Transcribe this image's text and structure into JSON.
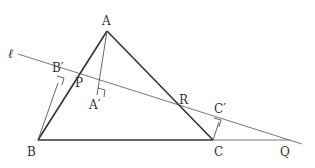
{
  "diagram": {
    "type": "geometry",
    "colors": {
      "triangle": "#333333",
      "line": "#777777",
      "perpendicular": "#555555",
      "label": "#333333"
    },
    "points": {
      "A": {
        "label": "A",
        "x": 107,
        "y": 31
      },
      "B": {
        "label": "B",
        "x": 38,
        "y": 140
      },
      "C": {
        "label": "C",
        "x": 213,
        "y": 140
      },
      "Q": {
        "label": "Q",
        "x": 290,
        "y": 140
      },
      "P": {
        "label": "P",
        "x": 82,
        "y": 91
      },
      "R": {
        "label": "R",
        "x": 181,
        "y": 110
      },
      "A_prime": {
        "label": "A′",
        "x": 97,
        "y": 95
      },
      "B_prime": {
        "label": "B′",
        "x": 58,
        "y": 83
      },
      "C_prime": {
        "label": "C′",
        "x": 219,
        "y": 122
      }
    },
    "line_label": "ℓ",
    "line_start": {
      "x": 18,
      "y": 54
    },
    "line_end": {
      "x": 302,
      "y": 144
    }
  }
}
